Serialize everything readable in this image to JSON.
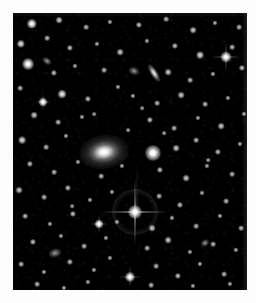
{
  "image": {
    "kind": "astronomical-sky-image",
    "description": "Deep monochrome optical image of a field of stars containing a bright elliptical galaxy with a diffuse halo, a close companion, an edge-on spiral galaxy, and a foreground star with four-point diffraction spikes.",
    "width": 256,
    "height": 303,
    "border": {
      "color": "#fdfdfd",
      "left": 13,
      "top": 13,
      "right": 9,
      "bottom": 13
    },
    "field": {
      "x": 13,
      "y": 13,
      "width": 234,
      "height": 277,
      "background_color": "#000000",
      "sky_color": "#050505"
    },
    "colors": {
      "star_white": "#ffffff",
      "halo_gray": "#b4b4b4",
      "sky_black": "#000000",
      "paper_white": "#fdfdfd"
    }
  },
  "objects": {
    "primary_galaxy": {
      "name": "elliptical-galaxy",
      "x": 104,
      "y": 152,
      "width": 50,
      "height": 34,
      "rotation": -8,
      "brightness": "very-bright"
    },
    "companion": {
      "name": "companion-object",
      "x": 153,
      "y": 153,
      "size": 16,
      "brightness": "bright"
    },
    "bright_star": {
      "name": "foreground-star-with-spikes",
      "x": 135,
      "y": 212,
      "size": 14,
      "spike_length": 66,
      "halo_size": 46,
      "brightness": "brightest"
    },
    "bleed_column": {
      "name": "detector-bleed-column",
      "x": 137,
      "y_top": 160,
      "height": 52,
      "width": 1
    },
    "edge_on_galaxy": {
      "name": "edge-on-spiral-galaxy",
      "x": 154,
      "y": 73,
      "length": 20,
      "thickness": 7,
      "rotation": 58
    },
    "faint_galaxies": [
      {
        "x": 134,
        "y": 71,
        "w": 11,
        "h": 8,
        "rotation": 20
      },
      {
        "x": 55,
        "y": 253,
        "w": 13,
        "h": 9,
        "rotation": -15
      },
      {
        "x": 47,
        "y": 61,
        "w": 10,
        "h": 7,
        "rotation": 35
      },
      {
        "x": 205,
        "y": 243,
        "w": 9,
        "h": 7,
        "rotation": -30
      }
    ],
    "secondary_stars": [
      {
        "x": 226,
        "y": 57,
        "size": 11,
        "spike_length": 30
      },
      {
        "x": 130,
        "y": 277,
        "size": 10,
        "spike_length": 22
      },
      {
        "x": 99,
        "y": 224,
        "size": 9,
        "spike_length": 18
      },
      {
        "x": 43,
        "y": 102,
        "size": 9,
        "spike_length": 16
      }
    ],
    "field_stars": [
      {
        "x": 32,
        "y": 24,
        "s": 4.0
      },
      {
        "x": 59,
        "y": 20,
        "s": 2.6
      },
      {
        "x": 86,
        "y": 27,
        "s": 2.2
      },
      {
        "x": 110,
        "y": 22,
        "s": 2.0
      },
      {
        "x": 139,
        "y": 25,
        "s": 2.4
      },
      {
        "x": 166,
        "y": 19,
        "s": 2.2
      },
      {
        "x": 193,
        "y": 30,
        "s": 2.6
      },
      {
        "x": 215,
        "y": 23,
        "s": 2.0
      },
      {
        "x": 239,
        "y": 27,
        "s": 2.2
      },
      {
        "x": 21,
        "y": 44,
        "s": 3.2
      },
      {
        "x": 47,
        "y": 38,
        "s": 2.2
      },
      {
        "x": 70,
        "y": 48,
        "s": 2.4
      },
      {
        "x": 97,
        "y": 44,
        "s": 2.0
      },
      {
        "x": 120,
        "y": 52,
        "s": 2.6
      },
      {
        "x": 147,
        "y": 41,
        "s": 2.0
      },
      {
        "x": 175,
        "y": 46,
        "s": 2.4
      },
      {
        "x": 200,
        "y": 55,
        "s": 3.0
      },
      {
        "x": 232,
        "y": 47,
        "s": 2.2
      },
      {
        "x": 28,
        "y": 64,
        "s": 4.6
      },
      {
        "x": 54,
        "y": 73,
        "s": 2.4
      },
      {
        "x": 75,
        "y": 66,
        "s": 2.0
      },
      {
        "x": 104,
        "y": 70,
        "s": 2.2
      },
      {
        "x": 118,
        "y": 87,
        "s": 2.0
      },
      {
        "x": 168,
        "y": 72,
        "s": 2.6
      },
      {
        "x": 190,
        "y": 80,
        "s": 2.2
      },
      {
        "x": 213,
        "y": 74,
        "s": 2.0
      },
      {
        "x": 242,
        "y": 68,
        "s": 2.4
      },
      {
        "x": 20,
        "y": 88,
        "s": 2.2
      },
      {
        "x": 62,
        "y": 94,
        "s": 3.4
      },
      {
        "x": 88,
        "y": 99,
        "s": 2.4
      },
      {
        "x": 133,
        "y": 96,
        "s": 2.0
      },
      {
        "x": 157,
        "y": 103,
        "s": 2.2
      },
      {
        "x": 181,
        "y": 95,
        "s": 2.6
      },
      {
        "x": 205,
        "y": 104,
        "s": 2.2
      },
      {
        "x": 228,
        "y": 98,
        "s": 2.0
      },
      {
        "x": 34,
        "y": 115,
        "s": 2.6
      },
      {
        "x": 58,
        "y": 122,
        "s": 2.2
      },
      {
        "x": 82,
        "y": 117,
        "s": 2.0
      },
      {
        "x": 150,
        "y": 120,
        "s": 2.4
      },
      {
        "x": 174,
        "y": 128,
        "s": 2.2
      },
      {
        "x": 198,
        "y": 118,
        "s": 2.0
      },
      {
        "x": 221,
        "y": 126,
        "s": 2.6
      },
      {
        "x": 244,
        "y": 114,
        "s": 2.0
      },
      {
        "x": 22,
        "y": 140,
        "s": 3.0
      },
      {
        "x": 46,
        "y": 147,
        "s": 2.2
      },
      {
        "x": 66,
        "y": 136,
        "s": 2.0
      },
      {
        "x": 176,
        "y": 148,
        "s": 2.6
      },
      {
        "x": 196,
        "y": 140,
        "s": 2.2
      },
      {
        "x": 218,
        "y": 152,
        "s": 2.4
      },
      {
        "x": 240,
        "y": 144,
        "s": 2.0
      },
      {
        "x": 30,
        "y": 164,
        "s": 2.4
      },
      {
        "x": 54,
        "y": 172,
        "s": 2.2
      },
      {
        "x": 78,
        "y": 162,
        "s": 2.0
      },
      {
        "x": 101,
        "y": 176,
        "s": 2.2
      },
      {
        "x": 122,
        "y": 166,
        "s": 2.0
      },
      {
        "x": 160,
        "y": 170,
        "s": 2.4
      },
      {
        "x": 186,
        "y": 178,
        "s": 2.6
      },
      {
        "x": 207,
        "y": 166,
        "s": 2.0
      },
      {
        "x": 232,
        "y": 174,
        "s": 2.2
      },
      {
        "x": 19,
        "y": 190,
        "s": 2.6
      },
      {
        "x": 44,
        "y": 197,
        "s": 2.2
      },
      {
        "x": 68,
        "y": 188,
        "s": 2.4
      },
      {
        "x": 90,
        "y": 200,
        "s": 2.0
      },
      {
        "x": 112,
        "y": 192,
        "s": 2.0
      },
      {
        "x": 159,
        "y": 196,
        "s": 2.2
      },
      {
        "x": 180,
        "y": 205,
        "s": 2.4
      },
      {
        "x": 202,
        "y": 193,
        "s": 2.0
      },
      {
        "x": 226,
        "y": 201,
        "s": 2.2
      },
      {
        "x": 25,
        "y": 216,
        "s": 2.2
      },
      {
        "x": 50,
        "y": 224,
        "s": 2.0
      },
      {
        "x": 73,
        "y": 214,
        "s": 2.4
      },
      {
        "x": 117,
        "y": 222,
        "s": 2.0
      },
      {
        "x": 152,
        "y": 228,
        "s": 2.6
      },
      {
        "x": 172,
        "y": 218,
        "s": 2.0
      },
      {
        "x": 196,
        "y": 226,
        "s": 2.2
      },
      {
        "x": 220,
        "y": 216,
        "s": 2.0
      },
      {
        "x": 241,
        "y": 228,
        "s": 2.2
      },
      {
        "x": 33,
        "y": 242,
        "s": 2.4
      },
      {
        "x": 61,
        "y": 236,
        "s": 2.0
      },
      {
        "x": 84,
        "y": 246,
        "s": 2.2
      },
      {
        "x": 106,
        "y": 238,
        "s": 2.0
      },
      {
        "x": 147,
        "y": 248,
        "s": 2.2
      },
      {
        "x": 168,
        "y": 240,
        "s": 2.6
      },
      {
        "x": 190,
        "y": 252,
        "s": 2.0
      },
      {
        "x": 213,
        "y": 244,
        "s": 2.2
      },
      {
        "x": 236,
        "y": 250,
        "s": 2.0
      },
      {
        "x": 21,
        "y": 264,
        "s": 2.2
      },
      {
        "x": 44,
        "y": 272,
        "s": 2.0
      },
      {
        "x": 70,
        "y": 262,
        "s": 2.4
      },
      {
        "x": 94,
        "y": 270,
        "s": 2.0
      },
      {
        "x": 110,
        "y": 258,
        "s": 2.0
      },
      {
        "x": 156,
        "y": 266,
        "s": 2.2
      },
      {
        "x": 178,
        "y": 276,
        "s": 2.4
      },
      {
        "x": 200,
        "y": 264,
        "s": 2.0
      },
      {
        "x": 224,
        "y": 274,
        "s": 2.2
      },
      {
        "x": 37,
        "y": 284,
        "s": 2.2
      },
      {
        "x": 64,
        "y": 288,
        "s": 2.0
      },
      {
        "x": 88,
        "y": 282,
        "s": 2.0
      },
      {
        "x": 151,
        "y": 285,
        "s": 2.2
      },
      {
        "x": 193,
        "y": 286,
        "s": 2.0
      },
      {
        "x": 230,
        "y": 284,
        "s": 2.0
      },
      {
        "x": 128,
        "y": 130,
        "s": 1.8
      },
      {
        "x": 164,
        "y": 133,
        "s": 1.8
      },
      {
        "x": 94,
        "y": 114,
        "s": 1.8
      },
      {
        "x": 142,
        "y": 108,
        "s": 1.8
      },
      {
        "x": 72,
        "y": 206,
        "s": 1.8
      },
      {
        "x": 208,
        "y": 160,
        "s": 1.8
      }
    ]
  }
}
